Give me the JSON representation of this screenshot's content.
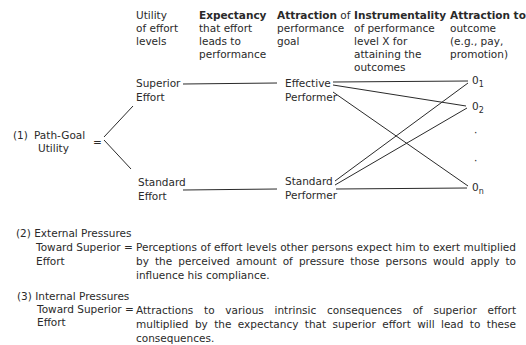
{
  "headers": [
    {
      "bold": "",
      "text": "Utility of effort levels",
      "lines": [
        "Utility",
        "of effort",
        "levels"
      ]
    },
    {
      "bold": "Expectancy",
      "lines": [
        "that effort",
        "leads to",
        "performance"
      ]
    },
    {
      "bold": "Attraction",
      "lines": [
        " of",
        "performance",
        "goal"
      ]
    },
    {
      "bold": "Instrumentality",
      "lines": [
        "of performance",
        "level X for",
        "attaining the",
        "outcomes"
      ]
    },
    {
      "bold": "Attraction to",
      "lines": [
        "outcome",
        "(e.g., pay,",
        "promotion)"
      ]
    }
  ],
  "equation1": {
    "number": "(1)",
    "label_line1": "Path-Goal",
    "label_line2": "Utility",
    "equals": "="
  },
  "effort_levels": {
    "superior_line1": "Superior",
    "superior_line2": "Effort",
    "standard_line1": "Standard",
    "standard_line2": "Effort"
  },
  "performance_goals": {
    "effective_line1": "Effective",
    "effective_line2": "Performer",
    "standard_line1": "Standard",
    "standard_line2": "Performer"
  },
  "outcomes": [
    {
      "base": "0",
      "sub": "1"
    },
    {
      "base": "0",
      "sub": "2"
    },
    {
      "base": "·",
      "sub": ""
    },
    {
      "base": "·",
      "sub": ""
    },
    {
      "base": "0",
      "sub": "n"
    }
  ],
  "equation2": {
    "number": "(2)",
    "label_line1": "External Pressures",
    "label_line2": "Toward Superior",
    "label_line3": "Effort",
    "equals": "=",
    "definition": "Perceptions of effort levels other persons expect him to exert multiplied by the perceived amount of pressure those persons would apply to influence his compliance."
  },
  "equation3": {
    "number": "(3)",
    "label_line1": "Internal Pressures",
    "label_line2": "Toward Superior",
    "label_line3": "Effort",
    "equals": "=",
    "definition": "Attractions to various intrinsic consequences of superior effort multiplied by the expectancy that superior effort will lead to these consequences."
  }
}
